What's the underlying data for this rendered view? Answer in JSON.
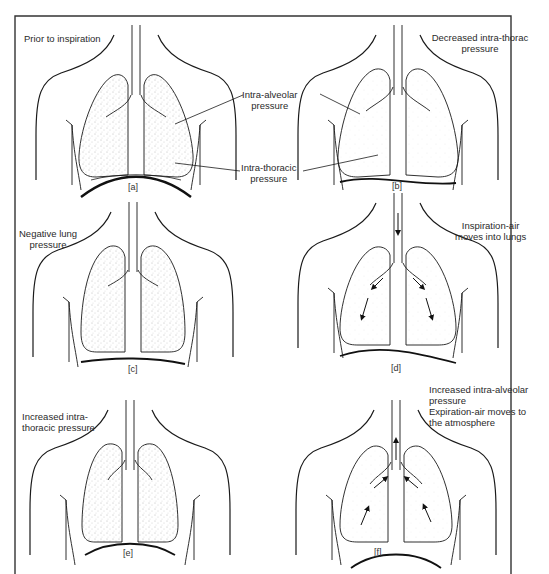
{
  "figure": {
    "panels": [
      {
        "id": "a",
        "tag": "[a]",
        "caption_lines": [
          "Prior to inspiration"
        ]
      },
      {
        "id": "b",
        "tag": "[b]",
        "caption_lines": [
          "Decreased intra-thorac",
          "pressure"
        ]
      },
      {
        "id": "c",
        "tag": "[c]",
        "caption_lines": [
          "Negative lung",
          "pressure"
        ]
      },
      {
        "id": "d",
        "tag": "[d]",
        "caption_lines": [
          "Inspiration-air",
          "moves into lungs"
        ]
      },
      {
        "id": "e",
        "tag": "[e]",
        "caption_lines": [
          "Increased intra-",
          "thoracic pressure"
        ]
      },
      {
        "id": "f",
        "tag": "[f]",
        "caption_lines": [
          "Increased intra-alveolar",
          "pressure",
          "Expiration-air moves to",
          "the atmosphere"
        ]
      }
    ],
    "callouts": {
      "intra_alveolar": [
        "Intra-alveolar",
        "pressure"
      ],
      "intra_thoracic": [
        "Intra-thoracic",
        "pressure"
      ]
    },
    "colors": {
      "ink": "#1a1a1a",
      "frame": "#333333",
      "stipple": "#8a8a8a"
    }
  }
}
